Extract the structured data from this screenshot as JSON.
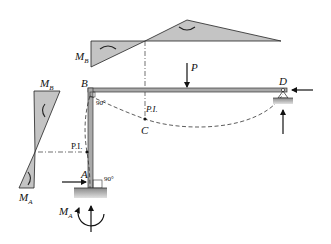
{
  "diagram": {
    "colors": {
      "member_fill": "#a9a9a9",
      "diagram_fill": "#c4c4c4",
      "stroke": "#222222",
      "ground": "#9a9a9a"
    },
    "labels": {
      "B": "B",
      "D": "D",
      "A": "A",
      "C": "C",
      "P": "P",
      "PI_beam": "P.I.",
      "PI_column": "P.I.",
      "angle_B": "90°",
      "angle_A": "90°",
      "MB_top": "M",
      "MB_top_sub": "B",
      "MB_left": "M",
      "MB_left_sub": "B",
      "MA_left": "M",
      "MA_left_sub": "A",
      "MA_base": "M",
      "MA_base_sub": "A"
    },
    "icons": {
      "load_arrow": "down-arrow",
      "reaction_arrows": [
        "right-arrow-at-A",
        "up-arrow-at-A",
        "moment-arc-at-A",
        "left-arrow-at-D",
        "up-arrow-at-D"
      ]
    }
  }
}
